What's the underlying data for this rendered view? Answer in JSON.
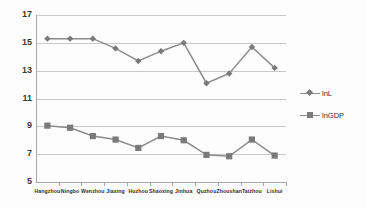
{
  "chart_data": {
    "type": "line",
    "title": "",
    "subtitle": "",
    "xlabel": "",
    "ylabel": "",
    "ylim": [
      5,
      17
    ],
    "yticks": [
      5,
      7,
      9,
      11,
      13,
      15,
      17
    ],
    "grid": true,
    "legend_position": "right",
    "categories": [
      "Hangzhou",
      "Ningbo",
      "Wenzhou",
      "Jiaxing",
      "Huzhou",
      "Shaoxing",
      "Jinhua",
      "Quzhou",
      "Zhoushan",
      "Taizhou",
      "Lishui"
    ],
    "series": [
      {
        "name": "lnL",
        "marker": "diamond",
        "color": "#808080",
        "values": [
          15.3,
          15.3,
          15.3,
          14.6,
          13.7,
          14.4,
          15.0,
          12.1,
          12.8,
          14.7,
          13.2
        ]
      },
      {
        "name": "lnGDP",
        "marker": "square",
        "color": "#808080",
        "values": [
          9.05,
          8.9,
          8.3,
          8.05,
          7.45,
          8.3,
          8.0,
          6.95,
          6.85,
          8.05,
          6.9
        ]
      }
    ]
  },
  "axis": {
    "y_tick_labels": [
      "17",
      "15",
      "13",
      "11",
      "9",
      "7",
      "5"
    ]
  },
  "legend": {
    "items": [
      {
        "label": "lnL"
      },
      {
        "label": "lnGDP"
      }
    ]
  },
  "colors": {
    "series_line": "#8c8c8c",
    "marker": "#7a7a7a",
    "gridline": "#c9c9c9",
    "axis": "#a8a8a8",
    "text": "#2e2e2e",
    "background": "#fdfdfd"
  }
}
